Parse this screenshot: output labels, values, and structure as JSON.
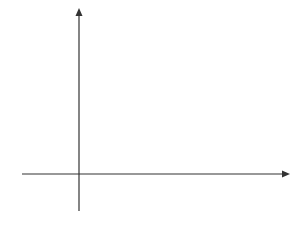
{
  "chart_data": {
    "type": "line",
    "title": "",
    "xlabel": "x",
    "ylabel": "y",
    "xlim": [
      -1.5,
      5.5
    ],
    "ylim": [
      -2,
      8.7
    ],
    "grid": true,
    "x_ticks": [
      "1",
      "2",
      "3",
      "4",
      "5"
    ],
    "y_ticks": [
      "-2",
      "2",
      "4",
      "6",
      "8"
    ],
    "series": [
      {
        "name": "y = x^2 - 4x + 3",
        "type": "curve",
        "x": [
          -0.6,
          0,
          1,
          2,
          3,
          4,
          5,
          5.15
        ],
        "y": [
          5.76,
          3,
          0,
          -1,
          0,
          3,
          8,
          8.9
        ]
      },
      {
        "name": "plotted points",
        "type": "scatter",
        "marker": "x",
        "x": [
          0,
          1,
          2,
          3,
          4,
          5
        ],
        "y": [
          3,
          0,
          -1,
          0,
          3,
          8
        ]
      }
    ]
  },
  "labels": {
    "x_axis": "x",
    "y_axis": "y",
    "x1": "1",
    "x2": "2",
    "x3": "3",
    "x4": "4",
    "x5": "5",
    "y8": "8",
    "y6": "6",
    "y4": "4",
    "y2": "2",
    "yneg2": "−2"
  }
}
